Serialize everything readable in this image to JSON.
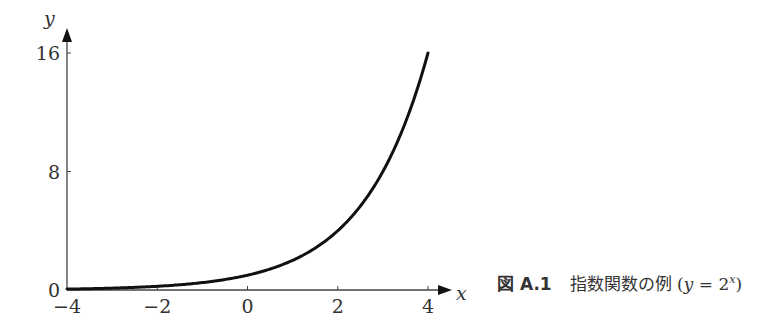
{
  "chart_data": {
    "type": "line",
    "title": "",
    "xlabel": "x",
    "ylabel": "y",
    "xlim": [
      -4,
      4
    ],
    "ylim": [
      0,
      16
    ],
    "xticks": [
      -4,
      -2,
      0,
      2,
      4
    ],
    "xtick_labels": [
      "−4",
      "−2",
      "0",
      "2",
      "4"
    ],
    "yticks": [
      0,
      8,
      16
    ],
    "ytick_labels": [
      "0",
      "8",
      "16"
    ],
    "grid": false,
    "series": [
      {
        "name": "y = 2^x",
        "function": "2^x",
        "x": [
          -4,
          -3,
          -2,
          -1,
          0,
          1,
          2,
          3,
          4
        ],
        "y": [
          0.0625,
          0.125,
          0.25,
          0.5,
          1,
          2,
          4,
          8,
          16
        ],
        "color": "#111111"
      }
    ]
  },
  "caption": {
    "figure_label": "図 A.1",
    "description": "指数関数の例",
    "formula_open": "(",
    "formula_lhs": "y",
    "formula_eq": " = 2",
    "formula_exp": "x",
    "formula_close": ")"
  }
}
